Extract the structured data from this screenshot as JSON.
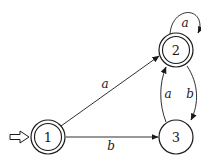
{
  "diagram": {
    "type": "finite-automaton",
    "states": [
      {
        "id": "1",
        "label": "1",
        "accepting": true,
        "initial": true
      },
      {
        "id": "2",
        "label": "2",
        "accepting": true,
        "initial": false
      },
      {
        "id": "3",
        "label": "3",
        "accepting": false,
        "initial": false
      }
    ],
    "transitions": [
      {
        "from": "1",
        "to": "2",
        "symbol": "a"
      },
      {
        "from": "1",
        "to": "3",
        "symbol": "b"
      },
      {
        "from": "2",
        "to": "2",
        "symbol": "a"
      },
      {
        "from": "2",
        "to": "3",
        "symbol": "b"
      },
      {
        "from": "3",
        "to": "2",
        "symbol": "a"
      }
    ],
    "colors": {
      "ink": "#1a1a1a",
      "background": "#ffffff"
    }
  }
}
